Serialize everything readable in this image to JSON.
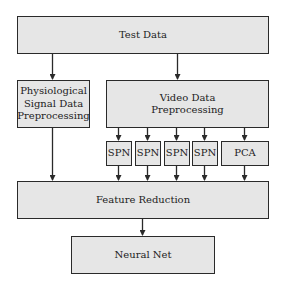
{
  "diagram": {
    "title": "",
    "nodes": {
      "test_data": {
        "label": "Test Data"
      },
      "physio": {
        "label": "Physiological Signal Data Preprocessing",
        "lines": [
          "Physiological",
          "Signal Data",
          "Preprocessing"
        ]
      },
      "video": {
        "label": "Video Data Preprocessing",
        "lines": [
          "Video Data",
          "Preprocessing"
        ]
      },
      "spn1": {
        "label": "SPN"
      },
      "spn2": {
        "label": "SPN"
      },
      "spn3": {
        "label": "SPN"
      },
      "spn4": {
        "label": "SPN"
      },
      "pca": {
        "label": "PCA"
      },
      "feature_reduction": {
        "label": "Feature Reduction"
      },
      "neural_net": {
        "label": "Neural Net"
      }
    },
    "edges": [
      {
        "from": "Test Data",
        "to": "Physiological Signal Data Preprocessing"
      },
      {
        "from": "Test Data",
        "to": "Video Data Preprocessing"
      },
      {
        "from": "Video Data Preprocessing",
        "to": "SPN"
      },
      {
        "from": "Video Data Preprocessing",
        "to": "SPN"
      },
      {
        "from": "Video Data Preprocessing",
        "to": "SPN"
      },
      {
        "from": "Video Data Preprocessing",
        "to": "SPN"
      },
      {
        "from": "Video Data Preprocessing",
        "to": "PCA"
      },
      {
        "from": "Physiological Signal Data Preprocessing",
        "to": "Feature Reduction"
      },
      {
        "from": "SPN",
        "to": "Feature Reduction"
      },
      {
        "from": "SPN",
        "to": "Feature Reduction"
      },
      {
        "from": "SPN",
        "to": "Feature Reduction"
      },
      {
        "from": "SPN",
        "to": "Feature Reduction"
      },
      {
        "from": "PCA",
        "to": "Feature Reduction"
      },
      {
        "from": "Feature Reduction",
        "to": "Neural Net"
      }
    ],
    "colors": {
      "box_fill": "#e6e6e6",
      "border": "#2a2a2a",
      "arrow": "#2a2a2a"
    }
  }
}
